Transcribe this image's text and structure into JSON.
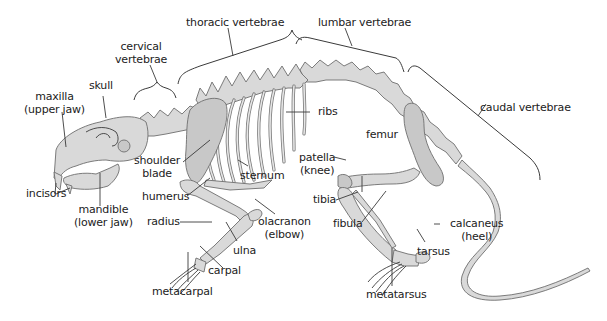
{
  "diagram": {
    "colors": {
      "bone": "#d9d9d9",
      "outline": "#6e6e6e",
      "text": "#222222",
      "background": "#ffffff"
    },
    "regions": {
      "cervical": [
        "cervical",
        "vertebrae"
      ],
      "thoracic": "thoracic vertebrae",
      "lumbar": "lumbar vertebrae",
      "caudal": "caudal vertebrae"
    },
    "labels": {
      "maxilla": [
        "maxilla",
        "(upper jaw)"
      ],
      "skull": "skull",
      "incisors": "incisors",
      "mandible": [
        "mandible",
        "(lower jaw)"
      ],
      "shoulder_blade": [
        "shoulder",
        "blade"
      ],
      "humerus": "humerus",
      "radius": "radius",
      "ulna": "ulna",
      "carpal": "carpal",
      "metacarpal": "metacarpal",
      "sternum": "sternum",
      "ribs": "ribs",
      "olacranon": [
        "olacranon",
        "(elbow)"
      ],
      "femur": "femur",
      "patella": [
        "patella",
        "(knee)"
      ],
      "tibia": "tibia",
      "fibula": "fibula",
      "calcaneus": [
        "calcaneus",
        "(heel)"
      ],
      "tarsus": "tarsus",
      "metatarsus": "metatarsus"
    }
  }
}
